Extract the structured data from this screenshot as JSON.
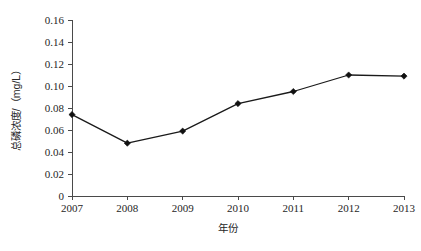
{
  "chart_data": {
    "type": "line",
    "title": "",
    "xlabel": "年份",
    "ylabel": "总磷浓度/（mg/L）",
    "categories": [
      "2007",
      "2008",
      "2009",
      "2010",
      "2011",
      "2012",
      "2013"
    ],
    "values": [
      0.074,
      0.048,
      0.059,
      0.084,
      0.095,
      0.11,
      0.109
    ],
    "series": [
      {
        "name": "总磷浓度",
        "values": [
          0.074,
          0.048,
          0.059,
          0.084,
          0.095,
          0.11,
          0.109
        ]
      }
    ],
    "ylim": [
      0,
      0.16
    ],
    "y_ticks": [
      0,
      0.02,
      0.04,
      0.06,
      0.08,
      0.1,
      0.12,
      0.14,
      0.16
    ],
    "y_tick_labels": [
      "0",
      "0.02",
      "0.04",
      "0.06",
      "0.08",
      "0.10",
      "0.12",
      "0.14",
      "0.16"
    ],
    "x_tick_labels": [
      "2007",
      "2008",
      "2009",
      "2010",
      "2011",
      "2012",
      "2013"
    ],
    "grid": false,
    "legend": false,
    "marker": "diamond",
    "line_color": "#1a1a1a",
    "marker_color": "#111111",
    "axis_color": "#4a4a4a",
    "background_color": "#ffffff"
  },
  "axis_titles": {
    "x": "年份",
    "y": "总磷浓度/（mg/L）"
  }
}
